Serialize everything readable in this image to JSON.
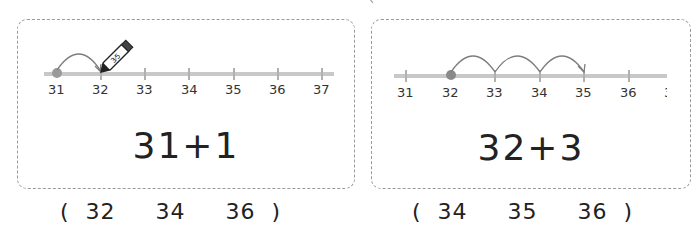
{
  "problems": [
    {
      "number_line": {
        "labels": [
          "31",
          "32",
          "33",
          "34",
          "35",
          "36",
          "37"
        ],
        "start": "31",
        "jumps": 1,
        "end": "32",
        "has_pencil": true
      },
      "expression": "31+1",
      "choices_text": "(  32     34     36  )",
      "choices": [
        "32",
        "34",
        "36"
      ]
    },
    {
      "number_line": {
        "labels": [
          "31",
          "32",
          "33",
          "34",
          "35",
          "36",
          "37"
        ],
        "start": "32",
        "jumps": 3,
        "end": "35",
        "has_pencil": false
      },
      "expression": "32+3",
      "choices_text": "(  34     35     36  )",
      "choices": [
        "34",
        "35",
        "36"
      ]
    }
  ],
  "colors": {
    "line": "#c8c8c8",
    "tick": "#b0b0b0",
    "dot": "#9a9a9a",
    "arc": "#7d7d7d",
    "border": "#9a9a9a"
  }
}
